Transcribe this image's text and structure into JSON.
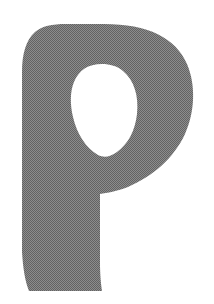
{
  "image": {
    "kind": "scanned-letterform",
    "character": "P",
    "description": "Bold rounded capital letter P",
    "width": 214,
    "height": 304
  },
  "colors": {
    "background": "#ffffff",
    "glyph_fill": "#7a7a7a",
    "glyph_fill_light": "#9a9a9a",
    "glyph_fill_dark": "#606060"
  },
  "glyph": {
    "name": "letter-p",
    "label": "P",
    "texture": "halftone-dither",
    "bounds": {
      "left": 21,
      "top": 24,
      "right": 193,
      "bottom": 292
    },
    "counter": {
      "name": "counter-bowl",
      "shape": "teardrop",
      "left": 70,
      "top": 64,
      "right": 137,
      "bottom": 158
    }
  }
}
